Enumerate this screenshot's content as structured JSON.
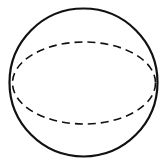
{
  "diagram": {
    "type": "sphere",
    "background": "#ffffff",
    "stroke_color": "#111111",
    "outline": {
      "shape": "circle",
      "cx": 83.5,
      "cy": 82.5,
      "r": 74,
      "stroke_width": 2.2,
      "style": "solid"
    },
    "equator": {
      "shape": "ellipse",
      "cx": 84,
      "cy": 83,
      "rx": 71.5,
      "ry": 41,
      "stroke_width": 1.6,
      "style": "dashed",
      "dasharray": "8 5"
    }
  }
}
